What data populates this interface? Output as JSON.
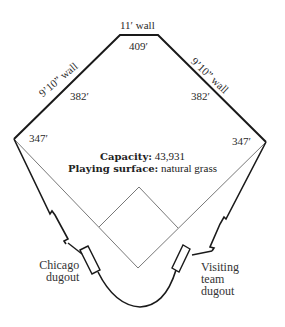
{
  "diagram": {
    "type": "ballpark-outfield-diagram",
    "walls": {
      "center": "11′ wall",
      "left_center": "9’10” wall",
      "right_center": "9’10” wall"
    },
    "distances": {
      "center_field": "409′",
      "left_center": "382′",
      "right_center": "382′",
      "left_field": "347′",
      "right_field": "347′"
    },
    "info": {
      "capacity_label": "Capacity:",
      "capacity_value": "43,931",
      "surface_label": "Playing surface:",
      "surface_value": "natural grass"
    },
    "dugouts": {
      "home": [
        "Chicago",
        "dugout"
      ],
      "visitor": [
        "Visiting",
        "team",
        "dugout"
      ]
    },
    "colors": {
      "line": "#1a1a1a",
      "thin_line": "#555555",
      "background": "#ffffff"
    }
  }
}
